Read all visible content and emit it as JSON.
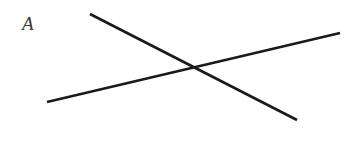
{
  "figure": {
    "label": "A",
    "label_color": "#3a3a3a",
    "background_color": "#ffffff",
    "width": 357,
    "height": 147
  },
  "chart_data": {
    "type": "line",
    "title": "A",
    "xlabel": "",
    "ylabel": "",
    "xlim": [
      0,
      357
    ],
    "ylim": [
      0,
      147
    ],
    "grid": false,
    "legend": "none",
    "annotations": [
      {
        "name": "figure-label",
        "text": "A",
        "x": 22,
        "y": 26
      }
    ],
    "series": [
      {
        "name": "descending-line",
        "stroke": "#1a1a1a",
        "stroke_width": 2.6,
        "x": [
          90,
          297
        ],
        "y": [
          14,
          120
        ]
      },
      {
        "name": "ascending-line",
        "stroke": "#1a1a1a",
        "stroke_width": 2.6,
        "x": [
          47,
          340
        ],
        "y": [
          102,
          33
        ]
      }
    ],
    "intersection": {
      "name": "crossing-point",
      "x": 195,
      "y": 68
    }
  }
}
